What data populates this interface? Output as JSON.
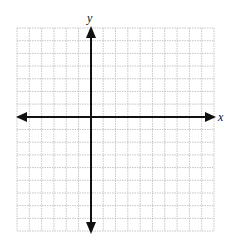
{
  "diagram": {
    "type": "coordinate-plane",
    "axes": {
      "x_label": "x",
      "y_label": "y",
      "arrows_both_ends": true
    },
    "grid": {
      "columns": 16,
      "rows": 16,
      "origin_column": 6,
      "origin_row": 7,
      "line_style": "dotted",
      "line_color": "#b8b8b8",
      "axis_color": "#111111"
    }
  }
}
